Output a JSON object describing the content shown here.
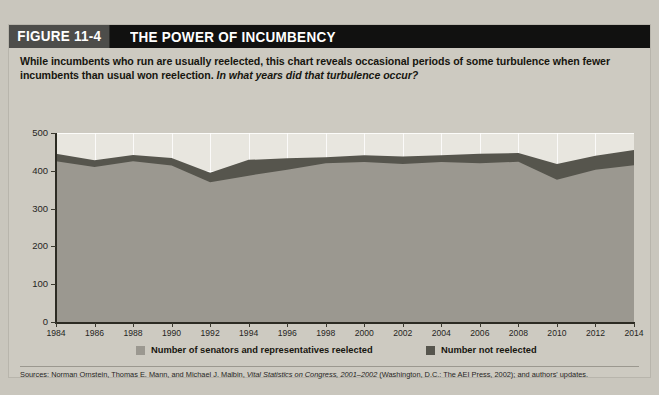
{
  "figure": {
    "number_label": "FIGURE 11-4",
    "title": "THE POWER OF INCUMBENCY",
    "subtitle_part1": "While incumbents who run are usually reelected, this chart reveals occasional periods of some turbulence when fewer incumbents than usual won reelection. ",
    "subtitle_question": "In what years did that turbulence occur?",
    "source_prefix": "Sources: Norman Ornstein, Thomas E. Mann, and Michael J. Malbin, ",
    "source_italic": "Vital Statistics on Congress, 2001–2002",
    "source_suffix": " (Washington, D.C.: The AEI Press, 2002); and authors' updates."
  },
  "legend": {
    "items": [
      {
        "label": "Number of senators and representatives reelected",
        "color": "#9b9890"
      },
      {
        "label": "Number not reelected",
        "color": "#56554d"
      }
    ]
  },
  "colors": {
    "header_bar": "#111110",
    "figure_number_bg": "#4d4d4a",
    "card_bg": "#cdcac1",
    "plot_bg": "#e8e6df",
    "reelected_fill": "#9b9890",
    "not_reelected_fill": "#56554d",
    "axis": "#2c2b23",
    "gridline": "#ffffff"
  },
  "chart_data": {
    "type": "area",
    "stacked": true,
    "title": "THE POWER OF INCUMBENCY",
    "xlabel": "",
    "ylabel": "",
    "xlim": [
      1984,
      2014
    ],
    "ylim": [
      0,
      500
    ],
    "yticks": [
      0,
      100,
      200,
      300,
      400,
      500
    ],
    "ytick_labels": [
      "0",
      "100",
      "200",
      "300",
      "400",
      "500"
    ],
    "xticks": [
      1984,
      1986,
      1988,
      1990,
      1992,
      1994,
      1996,
      1998,
      2000,
      2002,
      2004,
      2006,
      2008,
      2010,
      2012,
      2014
    ],
    "xtick_labels": [
      "1984",
      "1986",
      "1988",
      "1990",
      "1992",
      "1994",
      "1996",
      "1998",
      "2000",
      "2002",
      "2004",
      "2006",
      "2008",
      "2010",
      "2012",
      "2014"
    ],
    "grid": true,
    "legend_position": "bottom",
    "x": [
      1984,
      1986,
      1988,
      1990,
      1992,
      1994,
      1996,
      1998,
      2000,
      2002,
      2004,
      2006,
      2008,
      2010,
      2012,
      2014
    ],
    "series": [
      {
        "name": "Number of senators and representatives reelected",
        "color": "#9b9890",
        "values": [
          425,
          410,
          425,
          414,
          370,
          387,
          403,
          420,
          423,
          418,
          423,
          420,
          424,
          376,
          403,
          415
        ]
      },
      {
        "name": "Number not reelected",
        "color": "#56554d",
        "values": [
          20,
          18,
          17,
          20,
          25,
          42,
          30,
          16,
          18,
          20,
          18,
          25,
          23,
          42,
          37,
          40
        ]
      }
    ],
    "totals": [
      445,
      428,
      442,
      434,
      395,
      429,
      433,
      436,
      441,
      438,
      441,
      445,
      447,
      418,
      440,
      455
    ]
  }
}
